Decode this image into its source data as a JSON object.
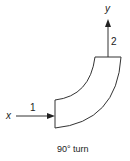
{
  "diagram": {
    "inlet": {
      "axis_label": "x",
      "station_label": "1"
    },
    "outlet": {
      "axis_label": "y",
      "station_label": "2"
    },
    "caption": "90° turn",
    "colors": {
      "stroke": "#333333",
      "background": "#ffffff",
      "text": "#222222"
    }
  }
}
